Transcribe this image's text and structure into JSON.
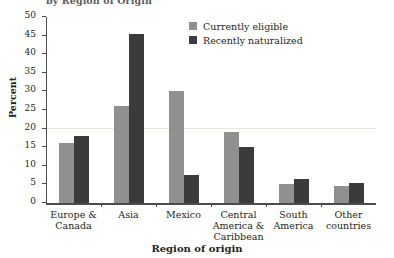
{
  "chart_data": {
    "type": "bar",
    "title": "by Region of Origin",
    "xlabel": "Region of origin",
    "ylabel": "Percent",
    "ylim": [
      0,
      50
    ],
    "ytick_step": 5,
    "yticks": [
      0,
      5,
      10,
      15,
      20,
      25,
      30,
      35,
      40,
      45,
      50
    ],
    "grid": "faint horizontal line at 20",
    "legend_position": "top-center",
    "categories": [
      "Europe & Canada",
      "Asia",
      "Mexico",
      "Central America & Caribbean",
      "South America",
      "Other countries"
    ],
    "category_lines": [
      [
        "Europe &",
        "Canada"
      ],
      [
        "Asia"
      ],
      [
        "Mexico"
      ],
      [
        "Central",
        "America &",
        "Caribbean"
      ],
      [
        "South",
        "America"
      ],
      [
        "Other",
        "countries"
      ]
    ],
    "series": [
      {
        "name": "Currently eligible",
        "color": "#909090",
        "values": [
          16,
          26,
          30,
          19,
          5,
          4.5
        ]
      },
      {
        "name": "Recently naturalized",
        "color": "#3b3b3b",
        "values": [
          18,
          45.5,
          7.5,
          15,
          6.5,
          5.5
        ]
      }
    ]
  },
  "colors": {
    "series_light": "#909090",
    "series_dark": "#3b3b3b",
    "axis": "#4b4b4b",
    "gridline": "#e9e4da",
    "text": "#231f20",
    "background": "#ffffff"
  }
}
